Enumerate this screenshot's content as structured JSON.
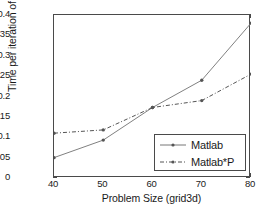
{
  "chart_data": {
    "type": "line",
    "title": "",
    "xlabel": "Problem Size (grid3d)",
    "ylabel": "Time per iteration of CG (secs)",
    "x": [
      40,
      50,
      60,
      70,
      80
    ],
    "xlim": [
      40,
      80
    ],
    "ylim": [
      0,
      0.4
    ],
    "xticks": [
      "40",
      "50",
      "60",
      "70",
      "80"
    ],
    "yticks": [
      "0",
      "0.05",
      "0.1",
      "0.15",
      "0.2",
      "0.25",
      "0.3",
      "0.35",
      "0.4"
    ],
    "ytick_values": [
      0,
      0.05,
      0.1,
      0.15,
      0.2,
      0.25,
      0.3,
      0.35,
      0.4
    ],
    "grid": false,
    "legend_position": "lower right",
    "series": [
      {
        "name": "Matlab",
        "values": [
          0.05,
          0.093,
          0.173,
          0.24,
          0.38
        ],
        "linestyle": "solid",
        "marker": "point",
        "color": "#808080"
      },
      {
        "name": "Matlab*P",
        "values": [
          0.11,
          0.118,
          0.173,
          0.19,
          0.255
        ],
        "linestyle": "dashdot",
        "marker": "point",
        "color": "#555555"
      }
    ]
  },
  "legend": {
    "items": [
      {
        "label": "Matlab"
      },
      {
        "label": "Matlab*P"
      }
    ]
  },
  "axes": {
    "x_title": "Problem Size (grid3d)",
    "y_title": "Time per iteration of CG (secs)"
  }
}
